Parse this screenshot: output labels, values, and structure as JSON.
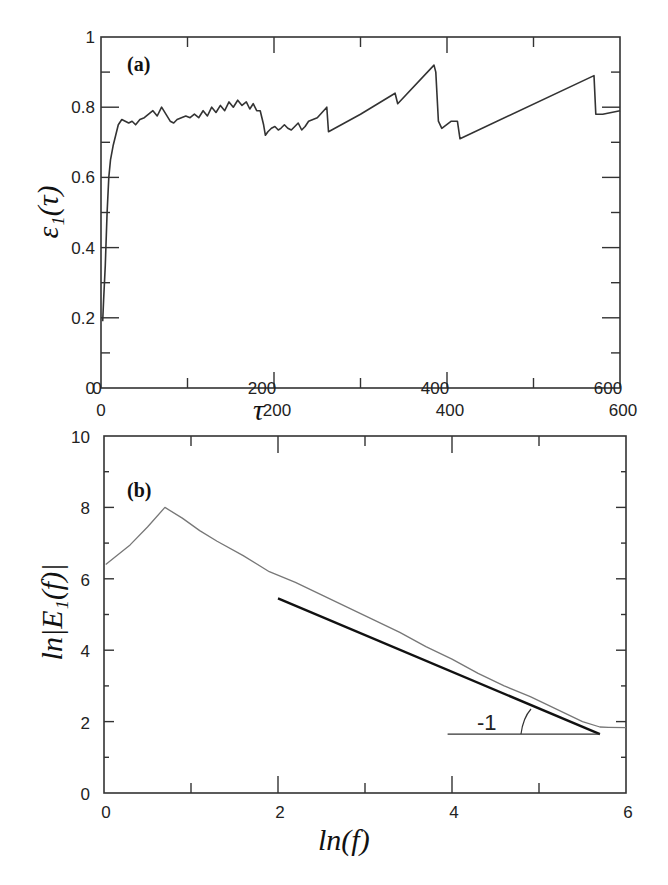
{
  "chart_data": [
    {
      "panel": "(a)",
      "type": "line",
      "title": "",
      "xlabel": "τ",
      "ylabel": "ε₁(τ)",
      "xlim": [
        0,
        600
      ],
      "ylim": [
        0,
        1
      ],
      "grid": false,
      "legend": null,
      "x_ticks": [
        0,
        200,
        400,
        600
      ],
      "x_tick_labels_bottom": [
        "0",
        "200",
        "400",
        "600"
      ],
      "x_tick_labels_overlay": [
        "0",
        "200",
        "400",
        "600"
      ],
      "y_ticks": [
        0,
        0.2,
        0.4,
        0.6,
        0.8,
        1
      ],
      "y_tick_labels": [
        "0",
        "0.2",
        "0.4",
        "0.6",
        "0.8",
        "1"
      ],
      "series": [
        {
          "name": "epsilon_1",
          "color": "#333333",
          "x": [
            2,
            3,
            5,
            7,
            9,
            11,
            14,
            17,
            20,
            24,
            28,
            32,
            36,
            40,
            45,
            50,
            55,
            60,
            65,
            70,
            75,
            80,
            84,
            88,
            93,
            98,
            103,
            108,
            113,
            118,
            123,
            128,
            133,
            138,
            143,
            148,
            153,
            158,
            163,
            168,
            172,
            176,
            180,
            184,
            186,
            188,
            190,
            193,
            197,
            201,
            205,
            208,
            212,
            216,
            220,
            224,
            228,
            232,
            236,
            240,
            250,
            261,
            263,
            300,
            340,
            343,
            385,
            387,
            390,
            394,
            405,
            412,
            415,
            570,
            572,
            575,
            580,
            600
          ],
          "values": [
            0.19,
            0.25,
            0.35,
            0.5,
            0.6,
            0.65,
            0.69,
            0.72,
            0.75,
            0.765,
            0.76,
            0.755,
            0.76,
            0.75,
            0.765,
            0.77,
            0.78,
            0.79,
            0.775,
            0.8,
            0.78,
            0.76,
            0.755,
            0.765,
            0.77,
            0.775,
            0.77,
            0.78,
            0.77,
            0.79,
            0.775,
            0.8,
            0.785,
            0.805,
            0.79,
            0.815,
            0.8,
            0.82,
            0.805,
            0.815,
            0.795,
            0.81,
            0.79,
            0.79,
            0.77,
            0.75,
            0.72,
            0.73,
            0.74,
            0.745,
            0.735,
            0.74,
            0.75,
            0.74,
            0.735,
            0.745,
            0.755,
            0.735,
            0.745,
            0.76,
            0.77,
            0.8,
            0.73,
            0.78,
            0.84,
            0.81,
            0.92,
            0.9,
            0.76,
            0.74,
            0.76,
            0.76,
            0.71,
            0.89,
            0.78,
            0.78,
            0.78,
            0.79
          ]
        }
      ]
    },
    {
      "panel": "(b)",
      "type": "line",
      "title": "",
      "xlabel": "ln(f)",
      "ylabel": "ln|E₁(f)|",
      "xlim": [
        0,
        6
      ],
      "ylim": [
        0,
        10
      ],
      "grid": false,
      "legend": null,
      "x_ticks": [
        0,
        1,
        2,
        3,
        4,
        5,
        6
      ],
      "x_tick_labels": [
        "0",
        "2",
        "4",
        "6"
      ],
      "y_ticks": [
        0,
        2,
        4,
        6,
        8,
        10
      ],
      "y_tick_labels": [
        "0",
        "2",
        "4",
        "6",
        "8",
        "10"
      ],
      "annotations": [
        {
          "text": "-1",
          "x": 4.4,
          "y": 2.0,
          "note": "slope triangle"
        }
      ],
      "series": [
        {
          "name": "spectrum",
          "color": "#666666",
          "x": [
            0.02,
            0.3,
            0.5,
            0.7,
            0.9,
            1.1,
            1.3,
            1.6,
            1.9,
            2.2,
            2.5,
            2.8,
            3.1,
            3.4,
            3.7,
            4.0,
            4.3,
            4.6,
            4.9,
            5.2,
            5.5,
            5.7,
            5.8,
            6.0
          ],
          "values": [
            6.4,
            6.95,
            7.45,
            8.0,
            7.7,
            7.35,
            7.05,
            6.65,
            6.2,
            5.9,
            5.55,
            5.2,
            4.85,
            4.5,
            4.1,
            3.75,
            3.35,
            3.0,
            2.7,
            2.35,
            2.0,
            1.85,
            1.84,
            1.83
          ]
        },
        {
          "name": "fit-slope-minus-1",
          "color": "#111111",
          "x": [
            2.0,
            5.7
          ],
          "values": [
            5.45,
            1.65
          ]
        },
        {
          "name": "baseline",
          "color": "#333333",
          "x": [
            3.95,
            5.7
          ],
          "values": [
            1.65,
            1.65
          ]
        }
      ]
    }
  ],
  "figure": {
    "panel_a_label": "(a)",
    "panel_b_label": "(b)",
    "slope_annotation": "-1",
    "a_xaxis_title": "τ",
    "b_xaxis_title": "ln(f)",
    "a_yaxis_title": "ε₁(τ)",
    "b_yaxis_title": "ln|E₁(f)|"
  }
}
